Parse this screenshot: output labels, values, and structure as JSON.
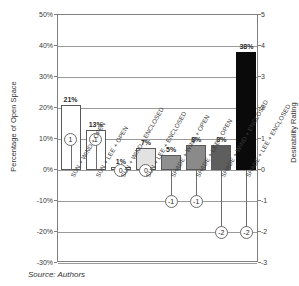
{
  "chart_data": {
    "type": "bar",
    "title": "",
    "xlabel": "",
    "ylabel": "Percentage of Open Space",
    "ylabel_secondary": "Desirability Rating",
    "ylim": [
      -30,
      50
    ],
    "ylim_secondary": [
      -3,
      5
    ],
    "grid": true,
    "legend": "none",
    "categories": [
      "SUN + WIND + OPEN",
      "SUN + LEE + OPEN",
      "SUN + WIND + ENCLOSED",
      "SUN + LEE + ENCLOSED",
      "SHADE + WIND + OPEN",
      "SHADE + LEE + OPEN",
      "SHADE + WIND + ENCLOSED",
      "SHADE + LEE + ENCLOSED"
    ],
    "yticks_left": [
      "50%",
      "40%",
      "30%",
      "20%",
      "10%",
      "0%",
      "-10%",
      "-20%",
      "-30%"
    ],
    "yticks_right": [
      "5",
      "4",
      "3",
      "2",
      "1",
      "0",
      "-1",
      "-2",
      "-3"
    ],
    "series": [
      {
        "name": "Percentage of Open Space",
        "axis": "left",
        "values": [
          21,
          13,
          1,
          7,
          5,
          8,
          8,
          38
        ],
        "labels": [
          "21%",
          "13%",
          "1%",
          "7%",
          "5%",
          "8%",
          "8%",
          "38%"
        ],
        "colors": [
          "#ffffff",
          "#ffffff",
          "#f2f2f2",
          "#e2e2e2",
          "#8f8f8f",
          "#8a8a8a",
          "#5e5e5e",
          "#0a0a0a"
        ]
      },
      {
        "name": "Desirability Rating",
        "axis": "right",
        "values": [
          1,
          1,
          0,
          0,
          -1,
          -1,
          -2,
          -2
        ],
        "labels": [
          "1",
          "1",
          "0",
          "0",
          "-1",
          "-1",
          "-2",
          "-2"
        ]
      }
    ]
  },
  "source": {
    "note": "Source: Authors"
  }
}
